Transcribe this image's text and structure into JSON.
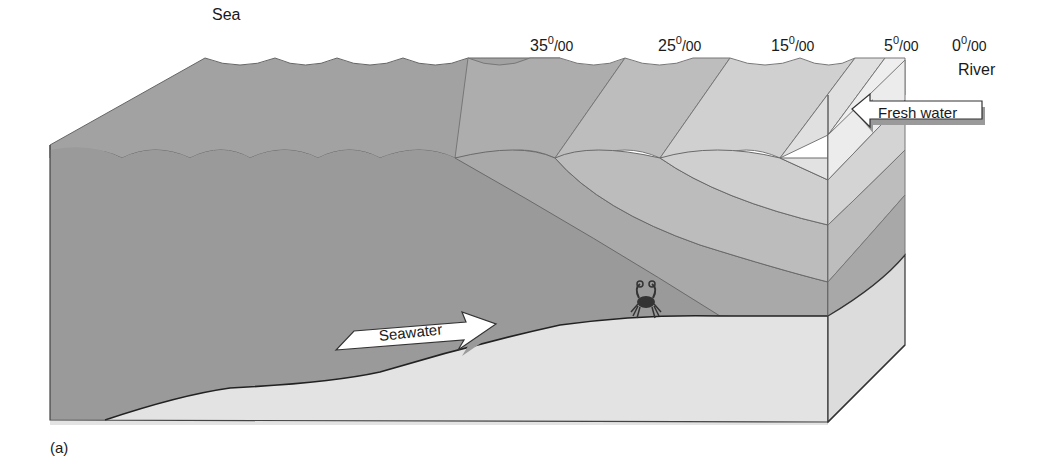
{
  "figure": {
    "caption": "(a)",
    "sea_label": "Sea",
    "river_label": "River",
    "salinity_labels": [
      {
        "value": "35",
        "sup": "0",
        "den": "/00"
      },
      {
        "value": "25",
        "sup": "0",
        "den": "/00"
      },
      {
        "value": "15",
        "sup": "0",
        "den": "/00"
      },
      {
        "value": "5",
        "sup": "0",
        "den": "/00"
      },
      {
        "value": "0",
        "sup": "0",
        "den": "/00"
      }
    ],
    "arrows": {
      "fresh_water": "Fresh water",
      "seawater": "Seawater"
    },
    "organism": "crab",
    "colors": {
      "sea_dark": "#9a9a9a",
      "band_35": "#a9a9a9",
      "band_25": "#bcbcbc",
      "band_15": "#cfcfcf",
      "band_5": "#e0e0e0",
      "band_0": "#ececec",
      "sediment": "#e3e3e3",
      "outline": "#333333",
      "arrow_fill": "#ffffff"
    }
  }
}
